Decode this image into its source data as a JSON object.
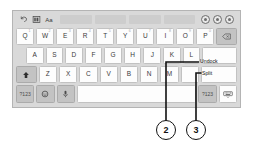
{
  "figure": {
    "type": "on-screen-keyboard-callout-diagram",
    "ink_color": "#111111"
  },
  "keyboard": {
    "toolbar": {
      "left_icons": [
        {
          "name": "undo-icon",
          "glyph": "undo"
        },
        {
          "name": "layout-icon",
          "glyph": "grid"
        },
        {
          "name": "text-size-icon",
          "label": "Aa"
        }
      ],
      "suggestion_cells": [
        "",
        "",
        "",
        ""
      ],
      "right_icons": [
        {
          "name": "settings-circle-icon"
        },
        {
          "name": "more-circle-icon"
        },
        {
          "name": "close-circle-icon"
        }
      ]
    },
    "rows": [
      {
        "id": "row-1",
        "keys": [
          {
            "label": "Q",
            "hint": "1",
            "type": "char"
          },
          {
            "label": "W",
            "hint": "2",
            "type": "char"
          },
          {
            "label": "E",
            "hint": "3",
            "type": "char"
          },
          {
            "label": "R",
            "hint": "4",
            "type": "char"
          },
          {
            "label": "T",
            "hint": "5",
            "type": "char"
          },
          {
            "label": "Y",
            "hint": "6",
            "type": "char"
          },
          {
            "label": "U",
            "hint": "7",
            "type": "char"
          },
          {
            "label": "I",
            "hint": "8",
            "type": "char"
          },
          {
            "label": "O",
            "hint": "9",
            "type": "char"
          },
          {
            "label": "P",
            "hint": "0",
            "type": "char"
          },
          {
            "label": "",
            "hint": "",
            "type": "backspace",
            "icon": "backspace-icon"
          }
        ]
      },
      {
        "id": "row-2",
        "keys": [
          {
            "label": "A",
            "hint": "",
            "type": "char"
          },
          {
            "label": "S",
            "hint": "",
            "type": "char"
          },
          {
            "label": "D",
            "hint": "",
            "type": "char"
          },
          {
            "label": "F",
            "hint": "",
            "type": "char"
          },
          {
            "label": "G",
            "hint": "",
            "type": "char"
          },
          {
            "label": "H",
            "hint": "",
            "type": "char"
          },
          {
            "label": "J",
            "hint": "",
            "type": "char"
          },
          {
            "label": "K",
            "hint": "",
            "type": "char"
          },
          {
            "label": "L",
            "hint": "",
            "type": "char"
          },
          {
            "label": "",
            "hint": "",
            "type": "enter",
            "icon": "enter-icon"
          }
        ]
      },
      {
        "id": "row-3",
        "keys": [
          {
            "label": "",
            "hint": "",
            "type": "shift",
            "icon": "shift-icon"
          },
          {
            "label": "Z",
            "hint": "",
            "type": "char"
          },
          {
            "label": "X",
            "hint": "",
            "type": "char"
          },
          {
            "label": "C",
            "hint": "",
            "type": "char"
          },
          {
            "label": "V",
            "hint": "",
            "type": "char"
          },
          {
            "label": "B",
            "hint": "",
            "type": "char"
          },
          {
            "label": "N",
            "hint": "",
            "type": "char"
          },
          {
            "label": "M",
            "hint": "",
            "type": "char"
          },
          {
            "label": "",
            "hint": "",
            "type": "blank"
          },
          {
            "label": "",
            "hint": "",
            "type": "blank"
          }
        ]
      },
      {
        "id": "row-4",
        "keys": [
          {
            "label": "?123",
            "hint": "",
            "type": "symbols"
          },
          {
            "label": "",
            "hint": "",
            "type": "emoji",
            "icon": "emoji-icon"
          },
          {
            "label": "",
            "hint": "",
            "type": "mic",
            "icon": "microphone-icon"
          },
          {
            "label": "",
            "hint": "",
            "type": "space"
          },
          {
            "label": "?123",
            "hint": "",
            "type": "symbols"
          },
          {
            "label": "",
            "hint": "",
            "type": "hide-keyboard",
            "icon": "hide-keyboard-icon"
          }
        ]
      }
    ]
  },
  "callouts": [
    {
      "number": "2",
      "label": "Undock"
    },
    {
      "number": "3",
      "label": "Split"
    }
  ]
}
